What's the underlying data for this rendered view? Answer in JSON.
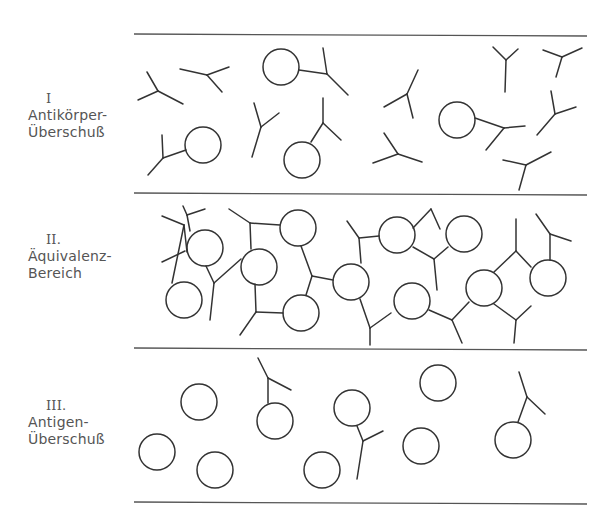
{
  "diagram": {
    "legend_items": [
      "Antigen (Kreis)",
      "Antikörper (Y-Form)"
    ],
    "zones": [
      {
        "numeral": "I",
        "line1": "Antikörper-",
        "line2": "Überschuß"
      },
      {
        "numeral": "II.",
        "line1": "Äquivalenz-",
        "line2": "Bereich"
      },
      {
        "numeral": "III.",
        "line1": "Antigen-",
        "line2": "Überschuß"
      }
    ]
  }
}
